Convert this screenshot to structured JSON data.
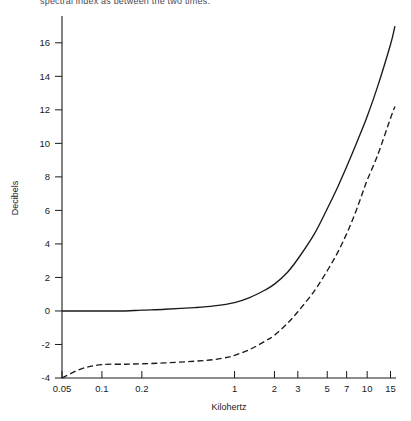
{
  "page": {
    "cut_off_header_text": "spectral index as between the two times."
  },
  "chart_data": {
    "type": "line",
    "title": "",
    "xlabel": "Kilohertz",
    "ylabel": "Decibels",
    "xscale": "log",
    "yscale": "linear",
    "xlim": [
      0.05,
      16.5
    ],
    "ylim": [
      -4,
      17.6
    ],
    "grid": false,
    "legend": "none",
    "xticks": [
      0.05,
      0.1,
      0.2,
      1,
      2,
      3,
      5,
      7,
      10,
      15
    ],
    "xtick_labels": [
      "0.05",
      "0.1",
      "0.2",
      "1",
      "2",
      "3",
      "5",
      "7",
      "10",
      "15"
    ],
    "yticks": [
      -4,
      -2,
      0,
      2,
      4,
      6,
      8,
      10,
      12,
      14,
      16
    ],
    "ytick_labels": [
      "-4",
      "-2",
      "0",
      "2",
      "4",
      "6",
      "8",
      "10",
      "12",
      "14",
      "16"
    ],
    "series": [
      {
        "name": "solid-curve",
        "style": "solid",
        "color": "#1a1a1a",
        "x": [
          0.05,
          0.07,
          0.1,
          0.15,
          0.2,
          0.3,
          0.5,
          0.7,
          1.0,
          1.3,
          1.7,
          2.0,
          2.5,
          3.0,
          4.0,
          5.0,
          6.0,
          7.0,
          8.5,
          10.0,
          12.0,
          15.0,
          16.2
        ],
        "values": [
          0.0,
          0.0,
          0.0,
          0.0,
          0.05,
          0.1,
          0.2,
          0.3,
          0.5,
          0.8,
          1.25,
          1.6,
          2.3,
          3.1,
          4.6,
          6.1,
          7.4,
          8.6,
          10.2,
          11.6,
          13.4,
          15.9,
          17.0
        ]
      },
      {
        "name": "dashed-curve",
        "style": "dashed",
        "color": "#1a1a1a",
        "x": [
          0.05,
          0.07,
          0.1,
          0.15,
          0.2,
          0.3,
          0.5,
          0.7,
          0.9,
          1.0,
          1.3,
          1.7,
          2.0,
          2.5,
          3.0,
          4.0,
          5.0,
          6.0,
          7.0,
          8.0,
          9.0,
          10.0,
          12.0,
          15.0,
          16.2
        ],
        "values": [
          -4.0,
          -3.45,
          -3.2,
          -3.18,
          -3.15,
          -3.1,
          -3.0,
          -2.9,
          -2.75,
          -2.65,
          -2.3,
          -1.8,
          -1.45,
          -0.75,
          -0.05,
          1.2,
          2.4,
          3.5,
          4.6,
          5.7,
          6.8,
          7.8,
          9.3,
          11.5,
          12.2
        ]
      }
    ]
  }
}
